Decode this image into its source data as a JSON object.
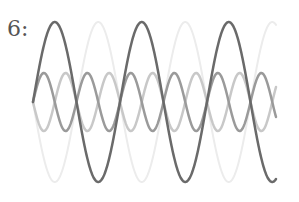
{
  "label": "6:",
  "figure": {
    "x_start": 33,
    "x_end": 276,
    "center_y": 102,
    "waves": [
      {
        "name": "large-wave-faint",
        "amplitude": 80,
        "period": 87,
        "phase_sign": -1,
        "color": "#ececec",
        "width": 2
      },
      {
        "name": "small-wave-light",
        "amplitude": 29,
        "period": 43.5,
        "phase_sign": -1,
        "color": "#c8c8c8",
        "width": 2.5
      },
      {
        "name": "small-wave-medium",
        "amplitude": 29,
        "period": 43.5,
        "phase_sign": 1,
        "color": "#9a9a9a",
        "width": 2.5
      },
      {
        "name": "large-wave-dark",
        "amplitude": 80,
        "period": 87,
        "phase_sign": 1,
        "color": "#6a6a6a",
        "width": 2.5
      }
    ]
  },
  "chart_data": {
    "type": "line",
    "title": "6:",
    "xlabel": "",
    "ylabel": "",
    "series": [
      {
        "name": "dark large sine",
        "amplitude": 1.0,
        "cycles": 2.8,
        "phase": 0
      },
      {
        "name": "faint large sine (inverted)",
        "amplitude": 1.0,
        "cycles": 2.8,
        "phase": 180
      },
      {
        "name": "medium small sine (double frequency)",
        "amplitude": 0.36,
        "cycles": 5.6,
        "phase": 0
      },
      {
        "name": "light small sine (double frequency, inverted)",
        "amplitude": 0.36,
        "cycles": 5.6,
        "phase": 180
      }
    ],
    "grid": false,
    "axes": false
  }
}
